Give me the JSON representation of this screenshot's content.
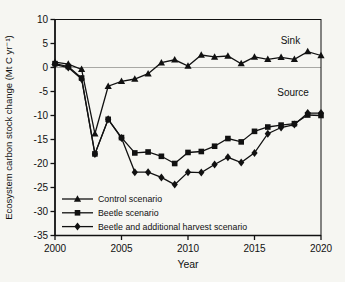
{
  "figure": {
    "background": "#f6f6f2",
    "ink": "#111111",
    "zero_line_color": "#a8a8a4",
    "annotations": [
      {
        "text": "Sink",
        "x": 2017.7,
        "y": 5.0
      },
      {
        "text": "Source",
        "x": 2017.9,
        "y": -5.9
      }
    ]
  },
  "chart_data": {
    "type": "line",
    "title": "",
    "xlabel": "Year",
    "ylabel": "Ecosystem carbon stock change (Mt C yr⁻¹)",
    "xlim": [
      2000,
      2020
    ],
    "ylim": [
      -35,
      10
    ],
    "x_ticks": [
      2000,
      2005,
      2010,
      2015,
      2020
    ],
    "y_ticks": [
      10,
      5,
      0,
      -5,
      -10,
      -15,
      -20,
      -25,
      -30,
      -35
    ],
    "grid": false,
    "zero_line": true,
    "legend_position": "inside lower-left",
    "x": [
      2000,
      2001,
      2002,
      2003,
      2004,
      2005,
      2006,
      2007,
      2008,
      2009,
      2010,
      2011,
      2012,
      2013,
      2014,
      2015,
      2016,
      2017,
      2018,
      2019,
      2020
    ],
    "series": [
      {
        "name": "Control scenario",
        "marker": "triangle",
        "color": "#111111",
        "values": [
          1.1,
          0.7,
          -0.4,
          -13.8,
          -3.9,
          -2.9,
          -2.4,
          -1.3,
          1.0,
          1.6,
          0.3,
          2.6,
          2.2,
          2.4,
          0.8,
          2.2,
          1.7,
          2.1,
          1.7,
          3.3,
          2.5
        ]
      },
      {
        "name": "Beetle scenario",
        "marker": "square",
        "color": "#111111",
        "values": [
          0.8,
          0.2,
          -2.2,
          -18.0,
          -10.8,
          -14.6,
          -17.8,
          -17.6,
          -18.5,
          -20.0,
          -17.7,
          -17.5,
          -16.4,
          -14.8,
          -15.5,
          -13.3,
          -12.4,
          -12.0,
          -11.7,
          -9.9,
          -10.0
        ]
      },
      {
        "name": "Beetle and additional harvest scenario",
        "marker": "diamond",
        "color": "#111111",
        "values": [
          0.6,
          0.0,
          -2.4,
          -18.0,
          -10.8,
          -14.7,
          -21.8,
          -21.8,
          -22.9,
          -24.4,
          -21.8,
          -21.9,
          -20.2,
          -18.7,
          -19.8,
          -17.8,
          -13.8,
          -12.5,
          -11.9,
          -9.5,
          -9.5
        ]
      }
    ]
  }
}
